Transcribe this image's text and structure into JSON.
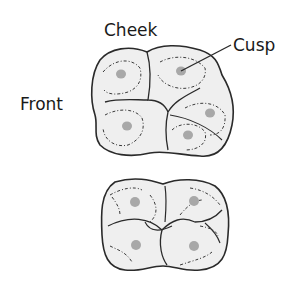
{
  "diagram": {
    "labels": {
      "cheek": "Cheek",
      "cusp": "Cusp",
      "front": "Front"
    },
    "teeth": [
      {
        "name": "upper-molar",
        "cusps": 5
      },
      {
        "name": "lower-molar",
        "cusps": 4
      }
    ],
    "colors": {
      "outline": "#2a2a2a",
      "fill": "#efefef",
      "cusp_dot": "#a8a8a8",
      "text": "#1a1a1a"
    }
  }
}
